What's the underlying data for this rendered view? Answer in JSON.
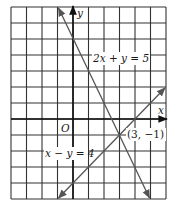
{
  "graph": {
    "x_range": [
      -4,
      6
    ],
    "y_range": [
      -5,
      7
    ],
    "axis_labels": {
      "x": "x",
      "y": "y",
      "origin": "O"
    },
    "lines": [
      {
        "equation": "2x + y = 5",
        "label": "2x + y = 5"
      },
      {
        "equation": "x - y = 4",
        "label": "x − y = 4"
      }
    ],
    "intersection": {
      "label": "(3, −1)",
      "x": 3,
      "y": -1
    }
  },
  "colors": {
    "grid": "#333333",
    "line": "#555555",
    "background": "#ffffff"
  }
}
